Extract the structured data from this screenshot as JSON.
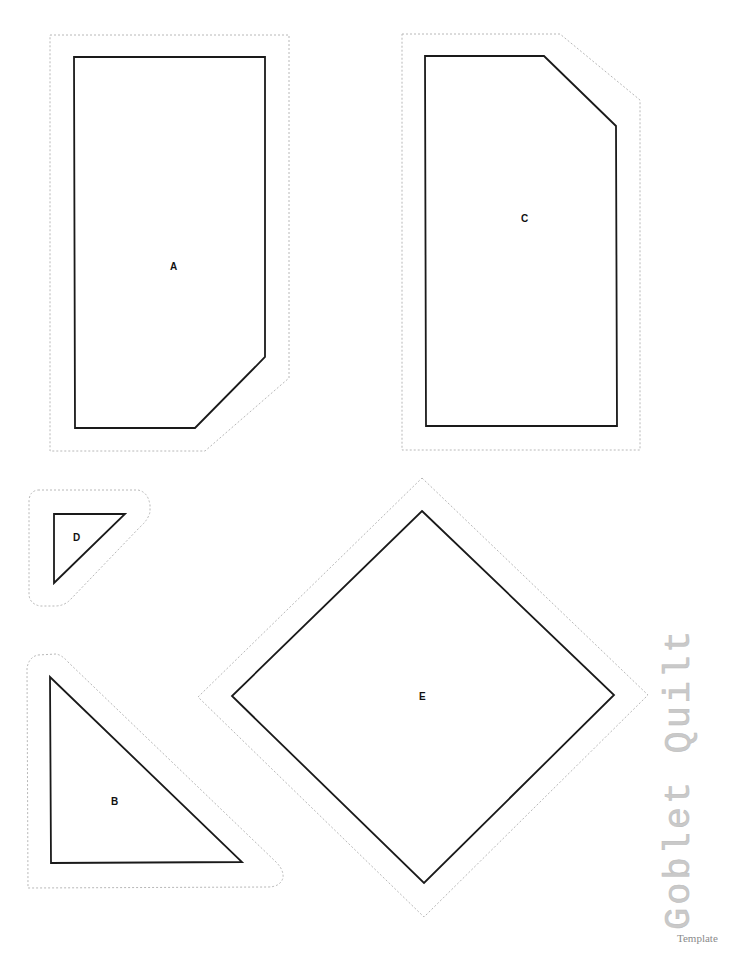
{
  "document": {
    "title": "Goblet Quilt",
    "subtitle": "Template"
  },
  "pieces": [
    {
      "id": "A",
      "label": "A"
    },
    {
      "id": "B",
      "label": "B"
    },
    {
      "id": "C",
      "label": "C"
    },
    {
      "id": "D",
      "label": "D"
    },
    {
      "id": "E",
      "label": "E"
    }
  ],
  "colors": {
    "sewing_line": "#1a1a1a",
    "cutting_line": "#b8b8b8",
    "title_text": "#c9c9c9"
  }
}
